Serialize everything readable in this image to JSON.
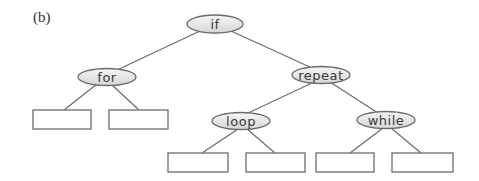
{
  "figure": {
    "label": "(b)",
    "colors": {
      "edge": "#6e6e6e",
      "node_border": "#6a6a6a",
      "node_fill_top": "#f4f4f4",
      "node_fill_bottom": "#d8d8d8",
      "text": "#3a3a3a"
    },
    "nodes": {
      "if": {
        "label": "if"
      },
      "for": {
        "label": "for"
      },
      "repeat": {
        "label": "repeat"
      },
      "loop": {
        "label": "loop"
      },
      "while": {
        "label": "while"
      }
    },
    "leaves": [
      {
        "parent": "for",
        "label": ""
      },
      {
        "parent": "for",
        "label": ""
      },
      {
        "parent": "loop",
        "label": ""
      },
      {
        "parent": "loop",
        "label": ""
      },
      {
        "parent": "while",
        "label": ""
      },
      {
        "parent": "while",
        "label": ""
      }
    ],
    "tree": {
      "if": [
        "for",
        "repeat"
      ],
      "for": [
        "leaf-1",
        "leaf-2"
      ],
      "repeat": [
        "loop",
        "while"
      ],
      "loop": [
        "leaf-3",
        "leaf-4"
      ],
      "while": [
        "leaf-5",
        "leaf-6"
      ]
    }
  }
}
